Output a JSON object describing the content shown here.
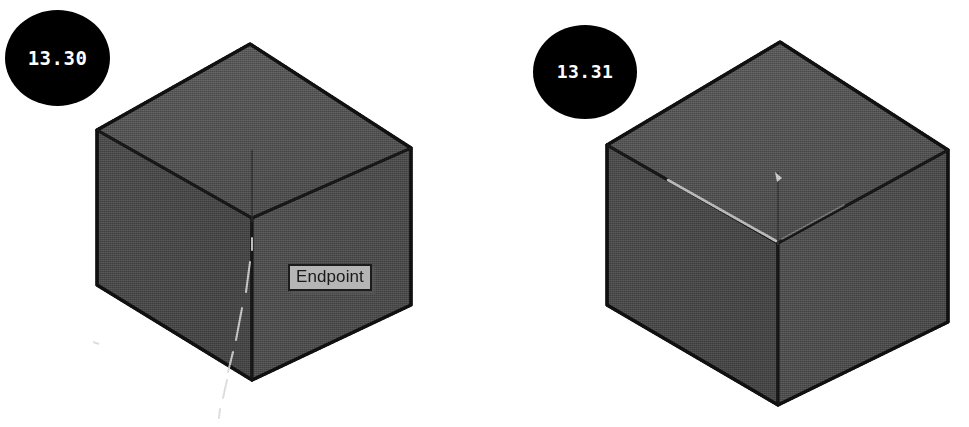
{
  "page": {
    "background_color": "#ffffff",
    "width": 969,
    "height": 427,
    "caption_style": "numbered black circle badges, CAD isometric cube illustrations"
  },
  "figures": [
    {
      "badge_label": "13.30",
      "badge_color": "#000000",
      "badge_text_color": "#ffffff",
      "tooltip": {
        "label": "Endpoint",
        "background_color": "#b5b5b5",
        "border_color": "#1c1c1c",
        "text_color": "#1a1a1a"
      },
      "object": "isometric-cube",
      "face_colors": {
        "top": "#535353",
        "left": "#4a4a4a",
        "right": "#4e4e4e",
        "outline": "#141414"
      },
      "annotations": [
        "vertical centre edge",
        "faint crosshair tracking line below cube",
        "endpoint snap marker at lower centre vertex"
      ]
    },
    {
      "badge_label": "13.31",
      "badge_color": "#000000",
      "badge_text_color": "#ffffff",
      "tooltip": null,
      "object": "isometric-cube",
      "face_colors": {
        "top": "#535353",
        "left": "#4a4a4a",
        "right": "#4e4e4e",
        "outline": "#141414"
      },
      "annotations": [
        "highlighted light edge along upper-left inner fold",
        "short light marker at top-face centre"
      ]
    }
  ]
}
